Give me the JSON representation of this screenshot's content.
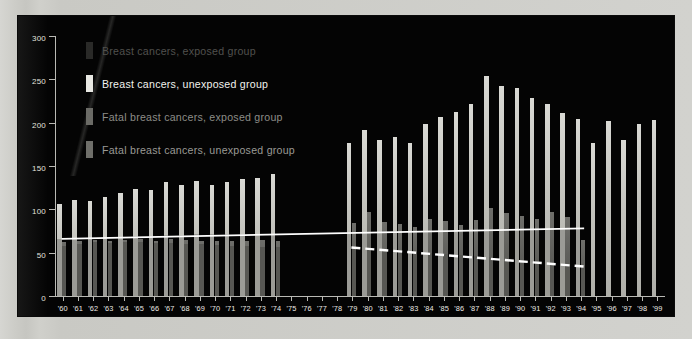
{
  "chart_data": {
    "type": "bar",
    "title": "",
    "xlabel": "",
    "ylabel": "",
    "ylim": [
      0,
      300
    ],
    "ytick_step": 50,
    "yticks": [
      0,
      50,
      100,
      150,
      200,
      250,
      300
    ],
    "ytick_labels": [
      "0",
      "50",
      "100",
      "150",
      "200",
      "250",
      "300"
    ],
    "grid": false,
    "legend_position": "upper-left-inside",
    "categories": [
      "'60",
      "'61",
      "'62",
      "'63",
      "'64",
      "'65",
      "'66",
      "'67",
      "'68",
      "'69",
      "'70",
      "'71",
      "'72",
      "'73",
      "'74",
      "'75",
      "'76",
      "'77",
      "'78",
      "'79",
      "'80",
      "'81",
      "'82",
      "'83",
      "'84",
      "'85",
      "'86",
      "'87",
      "'88",
      "'89",
      "'90",
      "'91",
      "'92",
      "'93",
      "'94",
      "'95",
      "'96",
      "'97",
      "'98",
      "'99"
    ],
    "series": [
      {
        "name": "Breast cancers, exposed group",
        "color": "#cfcfc9",
        "values": [
          106,
          111,
          110,
          114,
          119,
          124,
          122,
          131,
          128,
          133,
          128,
          131,
          135,
          136,
          141,
          null,
          null,
          null,
          null,
          177,
          191,
          180,
          184,
          177,
          199,
          206,
          212,
          221,
          254,
          242,
          240,
          228,
          222,
          211,
          204,
          177,
          202,
          180,
          198,
          203
        ]
      },
      {
        "name": "Breast cancers, unexposed group",
        "color": "#5e5e5a",
        "values": [
          62,
          64,
          65,
          63,
          65,
          66,
          64,
          66,
          65,
          64,
          64,
          63,
          64,
          65,
          63,
          null,
          null,
          null,
          null,
          84,
          97,
          85,
          83,
          80,
          89,
          86,
          82,
          88,
          101,
          96,
          92,
          89,
          97,
          91,
          65,
          null,
          null,
          null,
          null,
          null
        ]
      },
      {
        "name": "Fatal breast cancers, exposed group",
        "color": "#9b9b96",
        "values": [
          66,
          67,
          67,
          67,
          68,
          69,
          69,
          70,
          70,
          71,
          71,
          71,
          71,
          72,
          72,
          null,
          null,
          null,
          null,
          74,
          74,
          74,
          75,
          75,
          75,
          75,
          76,
          76,
          76,
          76,
          77,
          77,
          77,
          77,
          78,
          null,
          null,
          null,
          null,
          null
        ]
      },
      {
        "name": "Fatal breast cancers, unexposed group",
        "color": "#575753",
        "values": [
          58,
          60,
          62,
          61,
          62,
          62,
          61,
          61,
          60,
          60,
          59,
          58,
          58,
          57,
          56,
          null,
          null,
          null,
          null,
          55,
          54,
          53,
          52,
          51,
          50,
          49,
          47,
          46,
          45,
          43,
          42,
          41,
          39,
          37,
          35,
          null,
          null,
          null,
          null,
          null
        ]
      }
    ],
    "annotations": [
      {
        "name": "flat-trend-line",
        "style": "solid",
        "color": "#ffffff",
        "from": {
          "x": "'60",
          "y": 66
        },
        "to": {
          "x": "'94",
          "y": 78
        }
      },
      {
        "name": "declining-dashed-trend-line",
        "style": "dashed",
        "color": "#ffffff",
        "from": {
          "x": "'79",
          "y": 56
        },
        "to": {
          "x": "'94",
          "y": 34
        }
      }
    ],
    "data_gap": {
      "from": "'75",
      "to": "'78",
      "note": "no bars plotted"
    }
  },
  "legend": {
    "items": [
      {
        "label": "Breast cancers, exposed group",
        "swatch": "#2a2a28",
        "tone": "dim"
      },
      {
        "label": "Breast cancers, unexposed group",
        "swatch": "#e8e8e3",
        "tone": "bright"
      },
      {
        "label": "Fatal breast cancers, exposed group",
        "swatch": "#6b6b66",
        "tone": "mid"
      },
      {
        "label": "Fatal breast cancers, unexposed group",
        "swatch": "#6f6f6a",
        "tone": "mid2"
      }
    ]
  },
  "colors": {
    "background": "#cfcfcb",
    "plot_background": "#040404",
    "axis": "#b9b9b4",
    "tick_label": "#eceae6",
    "exposed_bar": "#cfcfc9",
    "unexposed_bar": "#5e5e5a",
    "trend_line": "#ffffff"
  }
}
